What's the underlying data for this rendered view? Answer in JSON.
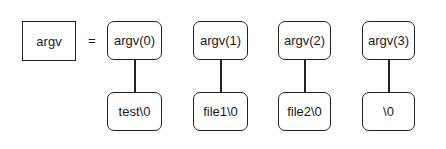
{
  "diagram": {
    "variable": {
      "label": "argv"
    },
    "operator": "=",
    "elements": [
      {
        "label": "argv(0)",
        "value": "test\\0"
      },
      {
        "label": "argv(1)",
        "value": "file1\\0"
      },
      {
        "label": "argv(2)",
        "value": "file2\\0"
      },
      {
        "label": "argv(3)",
        "value": "\\0"
      }
    ]
  }
}
